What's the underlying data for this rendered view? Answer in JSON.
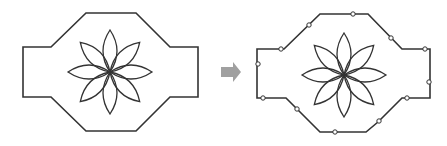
{
  "diagram": {
    "left_figure": {
      "outline_points": [
        [
          86,
          13
        ],
        [
          136,
          13
        ],
        [
          170,
          47
        ],
        [
          198,
          47
        ],
        [
          198,
          97
        ],
        [
          170,
          97
        ],
        [
          136,
          131
        ],
        [
          86,
          131
        ],
        [
          51,
          97
        ],
        [
          23,
          97
        ],
        [
          23,
          47
        ],
        [
          51,
          47
        ]
      ],
      "flower": {
        "cx": 110,
        "cy": 72,
        "petals": 8,
        "petal_length": 42,
        "petal_width": 14
      }
    },
    "arrow": {
      "color": "#a0a0a0",
      "direction": "right"
    },
    "right_figure": {
      "outline_points": [
        [
          320,
          14
        ],
        [
          368,
          14
        ],
        [
          402,
          49
        ],
        [
          430,
          49
        ],
        [
          430,
          98
        ],
        [
          402,
          98
        ],
        [
          378,
          122
        ],
        [
          366,
          132
        ],
        [
          320,
          132
        ],
        [
          286,
          98
        ],
        [
          257,
          98
        ],
        [
          257,
          49
        ],
        [
          284,
          49
        ]
      ],
      "flower": {
        "cx": 344,
        "cy": 75,
        "petals": 8,
        "petal_length": 42,
        "petal_width": 14
      },
      "nodes": [
        [
          353,
          14
        ],
        [
          309,
          25
        ],
        [
          281,
          49
        ],
        [
          258,
          64
        ],
        [
          263,
          98
        ],
        [
          297,
          109
        ],
        [
          335,
          132
        ],
        [
          379,
          121
        ],
        [
          407,
          98
        ],
        [
          429,
          82
        ],
        [
          425,
          49
        ],
        [
          391,
          38
        ]
      ]
    },
    "stroke_color": "#333333"
  }
}
